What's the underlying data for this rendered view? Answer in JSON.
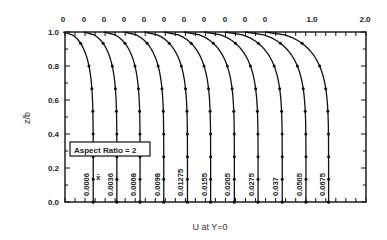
{
  "chart_data": {
    "type": "line",
    "title": "",
    "xlabel": "U at Y=0",
    "ylabel": "z/b",
    "annotation": "Aspect Ratio = 2",
    "legend_symbol": "x̄",
    "ylim": [
      0.0,
      1.0
    ],
    "yticks": [
      "0.0",
      "0.2",
      "0.4",
      "0.6",
      "0.8",
      "1.0"
    ],
    "top_ticks": [
      "0",
      "0",
      "0",
      "0",
      "0",
      "0",
      "0",
      "0",
      "0",
      "0",
      "0",
      "1.0",
      "2.0"
    ],
    "grid": false,
    "series": [
      {
        "name": "0.0006",
        "offset_x": 63,
        "u_max": 0.57
      },
      {
        "name": "0.0036",
        "offset_x": 84,
        "u_max": 0.62
      },
      {
        "name": "0.0068",
        "offset_x": 104,
        "u_max": 0.68
      },
      {
        "name": "0.0098",
        "offset_x": 124,
        "u_max": 0.75
      },
      {
        "name": "0.01275",
        "offset_x": 144,
        "u_max": 0.82
      },
      {
        "name": "0.0155",
        "offset_x": 164,
        "u_max": 0.88
      },
      {
        "name": "0.0205",
        "offset_x": 184,
        "u_max": 0.95
      },
      {
        "name": "0.0275",
        "offset_x": 204,
        "u_max": 1.02
      },
      {
        "name": "0.037",
        "offset_x": 225,
        "u_max": 1.08
      },
      {
        "name": "0.0505",
        "offset_x": 245,
        "u_max": 1.15
      },
      {
        "name": "0.0675",
        "offset_x": 265,
        "u_max": 1.2
      }
    ]
  }
}
